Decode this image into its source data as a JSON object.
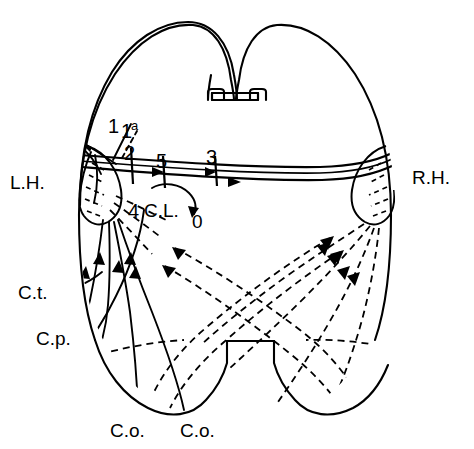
{
  "figure": {
    "background_color": "#ffffff",
    "line_color": "#000000",
    "width": 474,
    "height": 449
  },
  "labels": {
    "left_hemisphere": "L.H.",
    "right_hemisphere": "R.H.",
    "tract_t": "C.t.",
    "tract_p": "C.p.",
    "tract_o_left": "C.o.",
    "tract_o_right": "C.o.",
    "commissure_lateral": "C.L.",
    "zero": "0"
  },
  "numbered_markers": [
    {
      "id": "m1",
      "label": "1",
      "superscript": ""
    },
    {
      "id": "m1a",
      "label": "1",
      "superscript": "a"
    },
    {
      "id": "m2",
      "label": "2",
      "superscript": ""
    },
    {
      "id": "m5",
      "label": "5",
      "superscript": ""
    },
    {
      "id": "m3",
      "label": "3",
      "superscript": ""
    },
    {
      "id": "m4",
      "label": "4",
      "superscript": ""
    }
  ],
  "legend_notes": {
    "solid_lines": "solid fibres — left hemisphere projections",
    "dashed_lines": "dashed fibres — right hemisphere / crossed projections"
  }
}
